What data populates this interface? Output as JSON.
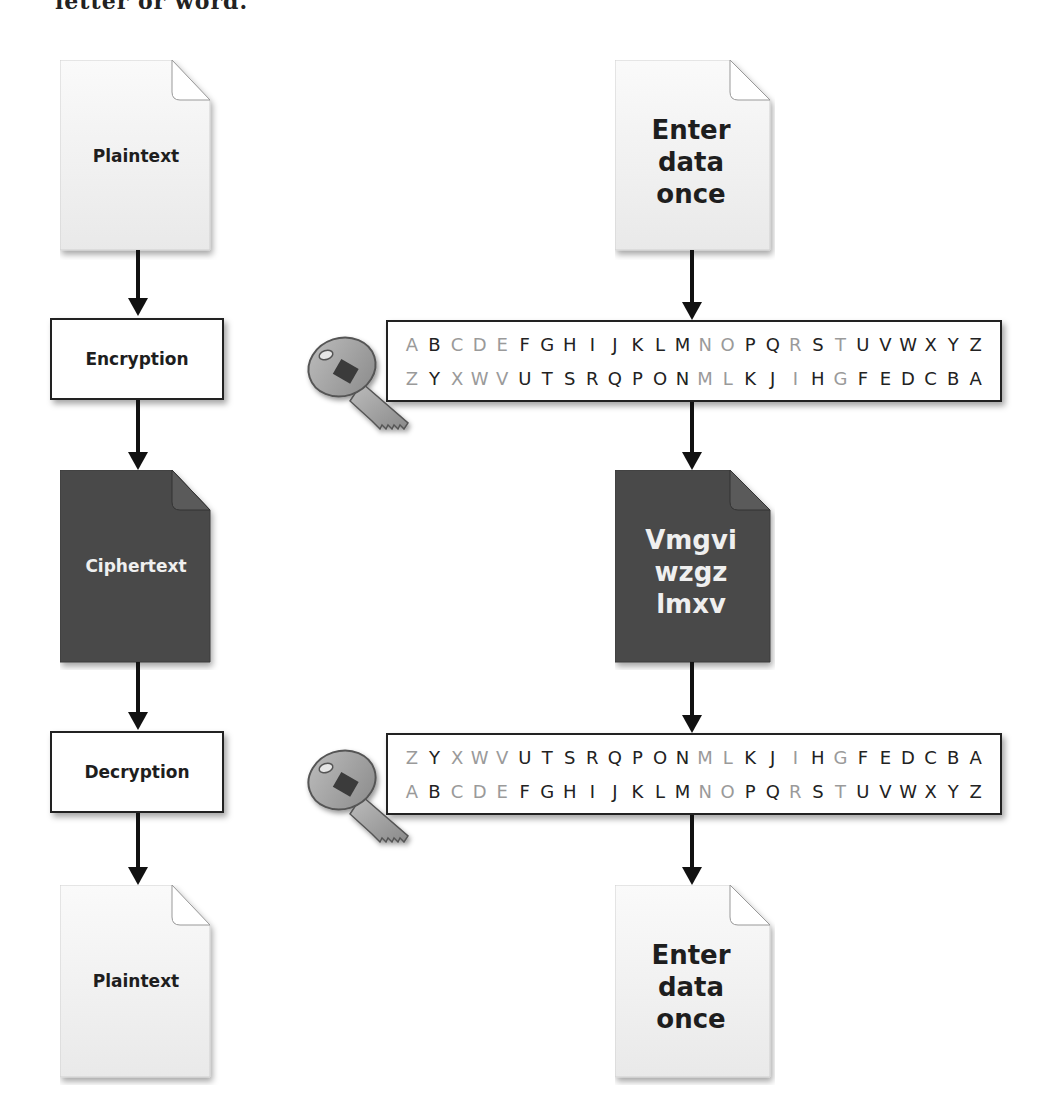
{
  "header": {
    "cut_off_text": "letter or word."
  },
  "left_flow": {
    "top_document": {
      "label": "Plaintext",
      "style": "light"
    },
    "encryption_step": {
      "label": "Encryption"
    },
    "middle_document": {
      "label": "Ciphertext",
      "style": "dark"
    },
    "decryption_step": {
      "label": "Decryption"
    },
    "bottom_document": {
      "label": "Plaintext",
      "style": "light"
    }
  },
  "right_flow": {
    "top_document": {
      "lines": [
        "Enter",
        "data",
        "once"
      ],
      "style": "light"
    },
    "encryption_cipher": {
      "key_icon": "key-icon",
      "row_top": [
        {
          "c": "A",
          "dim": true
        },
        {
          "c": "B",
          "dim": false
        },
        {
          "c": "C",
          "dim": true
        },
        {
          "c": "D",
          "dim": true
        },
        {
          "c": "E",
          "dim": true
        },
        {
          "c": "F",
          "dim": false
        },
        {
          "c": "G",
          "dim": false
        },
        {
          "c": "H",
          "dim": false
        },
        {
          "c": "I",
          "dim": false
        },
        {
          "c": "J",
          "dim": false
        },
        {
          "c": "K",
          "dim": false
        },
        {
          "c": "L",
          "dim": false
        },
        {
          "c": "M",
          "dim": false
        },
        {
          "c": "N",
          "dim": true
        },
        {
          "c": "O",
          "dim": true
        },
        {
          "c": "P",
          "dim": false
        },
        {
          "c": "Q",
          "dim": false
        },
        {
          "c": "R",
          "dim": true
        },
        {
          "c": "S",
          "dim": false
        },
        {
          "c": "T",
          "dim": true
        },
        {
          "c": "U",
          "dim": false
        },
        {
          "c": "V",
          "dim": false
        },
        {
          "c": "W",
          "dim": false
        },
        {
          "c": "X",
          "dim": false
        },
        {
          "c": "Y",
          "dim": false
        },
        {
          "c": "Z",
          "dim": false
        }
      ],
      "row_bottom": [
        {
          "c": "Z",
          "dim": true
        },
        {
          "c": "Y",
          "dim": false
        },
        {
          "c": "X",
          "dim": true
        },
        {
          "c": "W",
          "dim": true
        },
        {
          "c": "V",
          "dim": true
        },
        {
          "c": "U",
          "dim": false
        },
        {
          "c": "T",
          "dim": false
        },
        {
          "c": "S",
          "dim": false
        },
        {
          "c": "R",
          "dim": false
        },
        {
          "c": "Q",
          "dim": false
        },
        {
          "c": "P",
          "dim": false
        },
        {
          "c": "O",
          "dim": false
        },
        {
          "c": "N",
          "dim": false
        },
        {
          "c": "M",
          "dim": true
        },
        {
          "c": "L",
          "dim": true
        },
        {
          "c": "K",
          "dim": false
        },
        {
          "c": "J",
          "dim": false
        },
        {
          "c": "I",
          "dim": true
        },
        {
          "c": "H",
          "dim": false
        },
        {
          "c": "G",
          "dim": true
        },
        {
          "c": "F",
          "dim": false
        },
        {
          "c": "E",
          "dim": false
        },
        {
          "c": "D",
          "dim": false
        },
        {
          "c": "C",
          "dim": false
        },
        {
          "c": "B",
          "dim": false
        },
        {
          "c": "A",
          "dim": false
        }
      ]
    },
    "middle_document": {
      "lines": [
        "Vmgvi",
        "wzgz",
        "lmxv"
      ],
      "style": "dark"
    },
    "decryption_cipher": {
      "key_icon": "key-icon",
      "row_top": [
        {
          "c": "Z",
          "dim": true
        },
        {
          "c": "Y",
          "dim": false
        },
        {
          "c": "X",
          "dim": true
        },
        {
          "c": "W",
          "dim": true
        },
        {
          "c": "V",
          "dim": true
        },
        {
          "c": "U",
          "dim": false
        },
        {
          "c": "T",
          "dim": false
        },
        {
          "c": "S",
          "dim": false
        },
        {
          "c": "R",
          "dim": false
        },
        {
          "c": "Q",
          "dim": false
        },
        {
          "c": "P",
          "dim": false
        },
        {
          "c": "O",
          "dim": false
        },
        {
          "c": "N",
          "dim": false
        },
        {
          "c": "M",
          "dim": true
        },
        {
          "c": "L",
          "dim": true
        },
        {
          "c": "K",
          "dim": false
        },
        {
          "c": "J",
          "dim": false
        },
        {
          "c": "I",
          "dim": true
        },
        {
          "c": "H",
          "dim": false
        },
        {
          "c": "G",
          "dim": true
        },
        {
          "c": "F",
          "dim": false
        },
        {
          "c": "E",
          "dim": false
        },
        {
          "c": "D",
          "dim": false
        },
        {
          "c": "C",
          "dim": false
        },
        {
          "c": "B",
          "dim": false
        },
        {
          "c": "A",
          "dim": false
        }
      ],
      "row_bottom": [
        {
          "c": "A",
          "dim": true
        },
        {
          "c": "B",
          "dim": false
        },
        {
          "c": "C",
          "dim": true
        },
        {
          "c": "D",
          "dim": true
        },
        {
          "c": "E",
          "dim": true
        },
        {
          "c": "F",
          "dim": false
        },
        {
          "c": "G",
          "dim": false
        },
        {
          "c": "H",
          "dim": false
        },
        {
          "c": "I",
          "dim": false
        },
        {
          "c": "J",
          "dim": false
        },
        {
          "c": "K",
          "dim": false
        },
        {
          "c": "L",
          "dim": false
        },
        {
          "c": "M",
          "dim": false
        },
        {
          "c": "N",
          "dim": true
        },
        {
          "c": "O",
          "dim": true
        },
        {
          "c": "P",
          "dim": false
        },
        {
          "c": "Q",
          "dim": false
        },
        {
          "c": "R",
          "dim": true
        },
        {
          "c": "S",
          "dim": false
        },
        {
          "c": "T",
          "dim": true
        },
        {
          "c": "U",
          "dim": false
        },
        {
          "c": "V",
          "dim": false
        },
        {
          "c": "W",
          "dim": false
        },
        {
          "c": "X",
          "dim": false
        },
        {
          "c": "Y",
          "dim": false
        },
        {
          "c": "Z",
          "dim": false
        }
      ]
    },
    "bottom_document": {
      "lines": [
        "Enter",
        "data",
        "once"
      ],
      "style": "light"
    }
  },
  "colors": {
    "light_doc_fill": "#f2f2f2",
    "dark_doc_fill": "#4a4a4a",
    "arrow": "#111111",
    "box_border": "#222222",
    "dim_letter": "#9a9a9a",
    "key_fill": "#9c9c9c"
  }
}
